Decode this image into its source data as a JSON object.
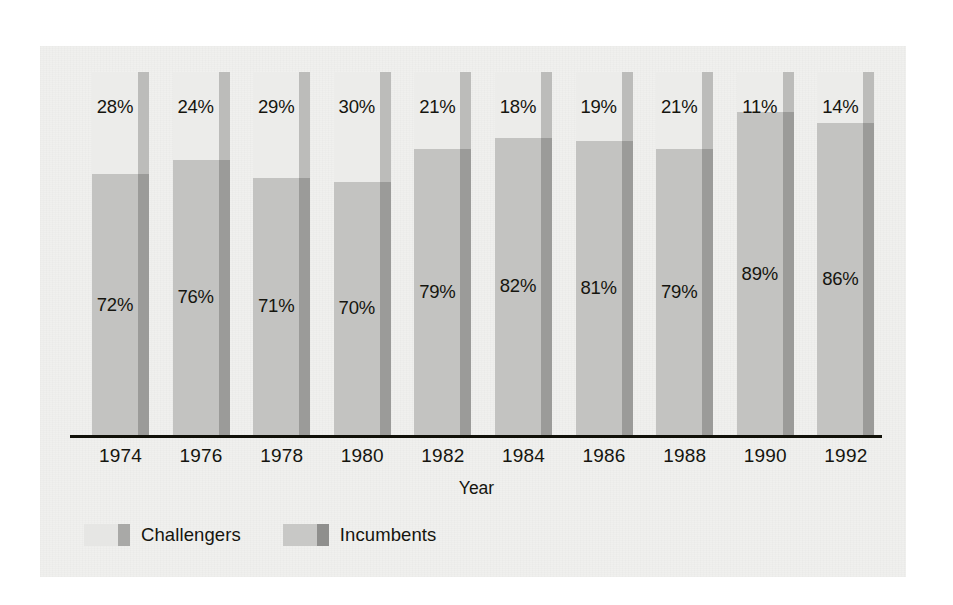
{
  "chart_data": {
    "type": "bar",
    "subtype": "100% stacked column",
    "title": "",
    "xlabel": "Year",
    "ylabel": "",
    "ylim": [
      0,
      100
    ],
    "grid": false,
    "legend_position": "bottom-left",
    "categories": [
      "1974",
      "1976",
      "1978",
      "1980",
      "1982",
      "1984",
      "1986",
      "1988",
      "1990",
      "1992"
    ],
    "series": [
      {
        "name": "Challengers",
        "color": "#ececea",
        "stack_position": "top",
        "values": [
          28,
          24,
          29,
          30,
          21,
          18,
          19,
          21,
          11,
          14
        ],
        "labels": [
          "28%",
          "24%",
          "29%",
          "30%",
          "21%",
          "18%",
          "19%",
          "21%",
          "11%",
          "14%"
        ]
      },
      {
        "name": "Incumbents",
        "color": "#c3c3c1",
        "stack_position": "bottom",
        "values": [
          72,
          76,
          71,
          70,
          79,
          82,
          81,
          79,
          89,
          86
        ],
        "labels": [
          "72%",
          "76%",
          "71%",
          "70%",
          "79%",
          "82%",
          "81%",
          "79%",
          "89%",
          "86%"
        ]
      }
    ]
  },
  "axis": {
    "x_title": "Year",
    "tick_labels": [
      "1974",
      "1976",
      "1978",
      "1980",
      "1982",
      "1984",
      "1986",
      "1988",
      "1990",
      "1992"
    ]
  },
  "legend": {
    "items": [
      {
        "label": "Challengers",
        "swatch_face": "#e6e6e4",
        "swatch_side": "#a9a9a7"
      },
      {
        "label": "Incumbents",
        "swatch_face": "#c8c8c6",
        "swatch_side": "#8f8f8d"
      }
    ]
  },
  "colors": {
    "panel_background": "#f0f0ee",
    "page_background": "#ffffff",
    "axis_line": "#111109",
    "text": "#15150f",
    "challengers_face": "#ececea",
    "challengers_side": "#bcbcba",
    "incumbents_face": "#c3c3c1",
    "incumbents_side": "#9b9b99"
  }
}
